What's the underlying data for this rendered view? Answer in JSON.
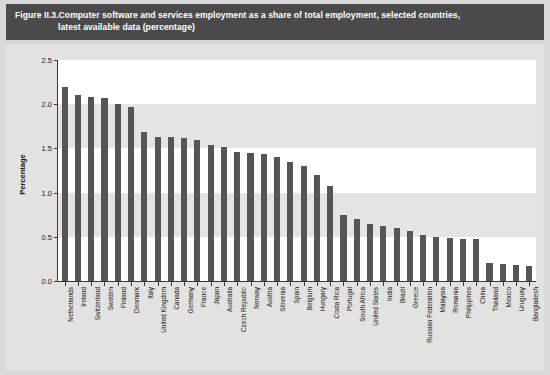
{
  "figure": {
    "label": "Figure II.3.",
    "title_line1": "Computer software and services employment as a share of total employment, selected countries,",
    "title_line2": "latest available data (percentage)",
    "banner_color": "#4a4a4a",
    "bar_color": "#555553",
    "panel_color": "#e2e2e0",
    "plot_color": "#ffffff",
    "band_color": "#e4e4e2"
  },
  "chart_data": {
    "type": "bar",
    "title": "Computer software and services employment as a share of total employment, selected countries, latest available data (percentage)",
    "xlabel": "",
    "ylabel": "Percentage",
    "ylim": [
      0.0,
      2.5
    ],
    "yticks": [
      "0.0",
      "0.5",
      "1.0",
      "1.5",
      "2.0",
      "2.5"
    ],
    "ytick_values": [
      0.0,
      0.5,
      1.0,
      1.5,
      2.0,
      2.5
    ],
    "grid": false,
    "legend": "none",
    "categories": [
      "Netherlands",
      "Ireland",
      "Switzerland",
      "Sweden",
      "Finland",
      "Denmark",
      "Italy",
      "United Kingdom",
      "Canada",
      "Germany",
      "France",
      "Japan",
      "Australia",
      "Czech Republic",
      "Norway",
      "Austria",
      "Slovenia",
      "Spain",
      "Belgium",
      "Hungary",
      "Costa Rica",
      "Portugal",
      "South Africa",
      "United States",
      "India",
      "Brazil",
      "Greece",
      "Russian Federation",
      "Malaysia",
      "Romania",
      "Philippines",
      "China",
      "Thailand",
      "Mexico",
      "Uruguay",
      "Bangladesh"
    ],
    "values": [
      2.2,
      2.1,
      2.08,
      2.07,
      2.0,
      1.97,
      1.69,
      1.63,
      1.63,
      1.62,
      1.6,
      1.54,
      1.52,
      1.46,
      1.45,
      1.44,
      1.4,
      1.35,
      1.3,
      1.2,
      1.08,
      0.75,
      0.7,
      0.65,
      0.62,
      0.6,
      0.57,
      0.52,
      0.5,
      0.49,
      0.48,
      0.47,
      0.2,
      0.19,
      0.18,
      0.17
    ]
  }
}
